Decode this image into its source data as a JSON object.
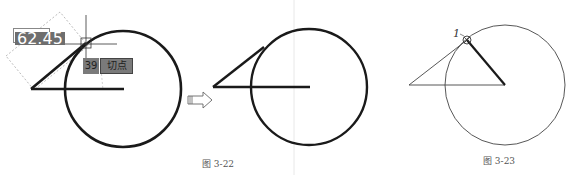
{
  "figures": [
    {
      "id": "fig-3-22-left",
      "dimension_input": "62.45",
      "tooltip_value": "39",
      "tooltip_label": "切点"
    },
    {
      "id": "fig-3-22-right"
    },
    {
      "id": "fig-3-23",
      "point_label": "1"
    }
  ],
  "captions": {
    "fig_3_22": "图 3-22",
    "fig_3_23": "图 3-23"
  },
  "arrow": "right-hollow-arrow",
  "colors": {
    "stroke": "#1a1a1a",
    "thin_stroke": "#444444",
    "tooltip_bg": "#7a7a7a",
    "separator": "#e6e6e6"
  }
}
